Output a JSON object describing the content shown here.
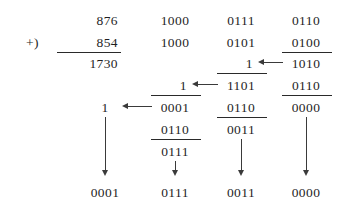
{
  "figure": {
    "ink_color": "#1f1f1f",
    "rule_color": "#2a2a2a",
    "arrow_color": "#3a3a3a",
    "background": "#ffffff"
  },
  "decimal": {
    "plus_sign": "+)",
    "addend_top": "876",
    "addend_bottom": "854",
    "sum": "1730"
  },
  "bcd": {
    "groups": [
      {
        "name": "thousands-group",
        "addend_top": "1000",
        "addend_bottom": "1000",
        "carry_in": "1",
        "partial_sum": "0001",
        "correction": "0110",
        "corrected_sum": "0111",
        "result": "0111"
      },
      {
        "name": "hundreds-group",
        "addend_top": "0111",
        "addend_bottom": "0101",
        "carry_in": "1",
        "partial_sum": "1101",
        "correction": "0110",
        "corrected_sum": "0011",
        "result": "0011"
      },
      {
        "name": "tens-group",
        "addend_top": "0110",
        "addend_bottom": "0100",
        "partial_sum": "1010",
        "correction": "0110",
        "corrected_sum": "0000",
        "result": "0000"
      }
    ],
    "final_carry_digit": "1",
    "final_carry_result": "0001"
  }
}
